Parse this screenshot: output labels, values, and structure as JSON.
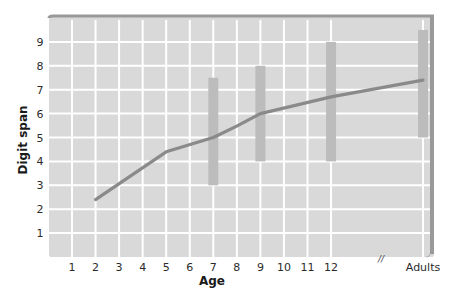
{
  "chart_data": {
    "type": "line",
    "title": "",
    "xlabel": "Age",
    "ylabel": "Digit span",
    "categories": [
      "1",
      "2",
      "3",
      "4",
      "5",
      "6",
      "7",
      "8",
      "9",
      "10",
      "11",
      "12",
      "Adults"
    ],
    "x_break_marker": "//",
    "ylim": [
      0,
      10
    ],
    "yticks": [
      1,
      2,
      3,
      4,
      5,
      6,
      7,
      8,
      9
    ],
    "grid": true,
    "legend": null,
    "series": [
      {
        "name": "Mean digit span",
        "kind": "line",
        "points": [
          {
            "x": "2",
            "y": 2.4
          },
          {
            "x": "5",
            "y": 4.4
          },
          {
            "x": "7",
            "y": 5.0
          },
          {
            "x": "9",
            "y": 6.0
          },
          {
            "x": "12",
            "y": 6.7
          },
          {
            "x": "Adults",
            "y": 7.4
          }
        ]
      },
      {
        "name": "Range",
        "kind": "range_bar",
        "ranges": [
          {
            "x": "7",
            "low": 3.0,
            "high": 7.5
          },
          {
            "x": "9",
            "low": 4.0,
            "high": 8.0
          },
          {
            "x": "12",
            "low": 4.0,
            "high": 9.0
          },
          {
            "x": "Adults",
            "low": 5.0,
            "high": 9.5
          }
        ]
      }
    ]
  },
  "colors": {
    "plot_bg": "#d9d9d9",
    "grid": "#ffffff",
    "frame": "#999999",
    "line": "#8a8a8a",
    "range_bar": "#bcbcbc",
    "text": "#2b2b2b"
  }
}
